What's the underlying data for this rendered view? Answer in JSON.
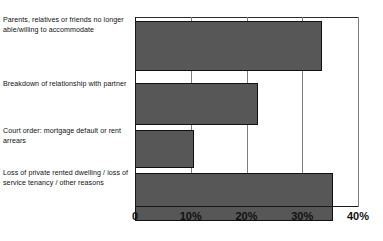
{
  "chart_data": {
    "type": "bar",
    "orientation": "horizontal",
    "title": "",
    "subtitle": "",
    "xlabel": "",
    "ylabel": "",
    "xlim": [
      0,
      40
    ],
    "grid": true,
    "legend": null,
    "categories": [
      "Parents, relatives or friends no longer able/willing to accommodate",
      "Breakdown of relationship with partner",
      "Court order: mortgage default or rent arrears",
      "Loss of private rented dwelling / loss of service tenancy / other reasons"
    ],
    "values": [
      33.5,
      22.0,
      10.5,
      35.5
    ],
    "xticks": [
      0,
      10,
      20,
      30,
      40
    ],
    "xtick_labels": [
      "0",
      "10%",
      "20%",
      "30%",
      "40%"
    ],
    "bar_color": "#575757",
    "bar_border_color": "#111111",
    "gridline_color": "#7d7d7d",
    "axis_color": "#1a1a1a"
  }
}
